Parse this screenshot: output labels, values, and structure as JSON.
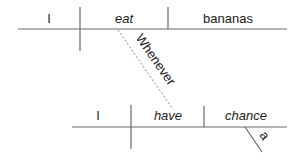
{
  "diagram": {
    "type": "Reed-Kellogg sentence diagram",
    "main_clause": {
      "subject": "I",
      "verb": "eat",
      "object": "bananas"
    },
    "connector": {
      "word": "Whenever",
      "style": "dashed"
    },
    "subordinate_clause": {
      "subject": "I",
      "verb": "have",
      "object": "chance",
      "object_modifier": "a"
    },
    "colors": {
      "line": "#6a6a6a",
      "dashed_line": "#8a8a8a",
      "text": "#222222",
      "background": "#ffffff"
    }
  }
}
